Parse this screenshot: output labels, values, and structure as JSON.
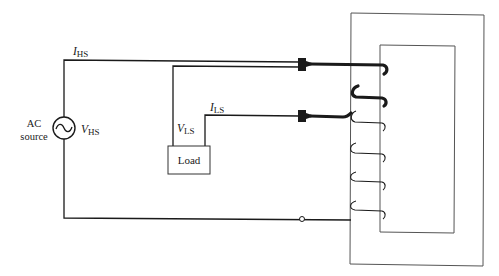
{
  "diagram": {
    "type": "autotransformer-circuit",
    "source": {
      "label_line1": "AC",
      "label_line2": "source",
      "voltage_symbol": "V",
      "voltage_subscript": "HS",
      "glyph": "~"
    },
    "high_side_current": {
      "symbol": "I",
      "subscript": "HS"
    },
    "low_side_voltage": {
      "symbol": "V",
      "subscript": "LS"
    },
    "low_side_current": {
      "symbol": "I",
      "subscript": "LS"
    },
    "load": {
      "label": "Load"
    },
    "core": {
      "description": "rectangular transformer core with window",
      "winding_turns_visible": 6,
      "thick_turns_upper": 2,
      "thin_turns_lower": 4
    },
    "colors": {
      "line": "#1a1a1a",
      "core_line": "#555555",
      "background": "#ffffff"
    }
  }
}
